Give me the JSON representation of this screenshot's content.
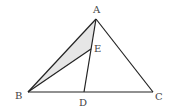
{
  "diagram": {
    "type": "geometry-triangle",
    "points": {
      "A": {
        "label": "A",
        "x": 96,
        "y": 19
      },
      "B": {
        "label": "B",
        "x": 28,
        "y": 92
      },
      "C": {
        "label": "C",
        "x": 153,
        "y": 92
      },
      "D": {
        "label": "D",
        "x": 84,
        "y": 92
      },
      "E": {
        "label": "E",
        "x": 91,
        "y": 49
      }
    },
    "segments": [
      "AB",
      "AC",
      "BC",
      "AD",
      "BE"
    ],
    "shaded_region": "ABE",
    "colors": {
      "line": "#222222",
      "shade": "#e6e6e6",
      "label": "#444444"
    }
  }
}
